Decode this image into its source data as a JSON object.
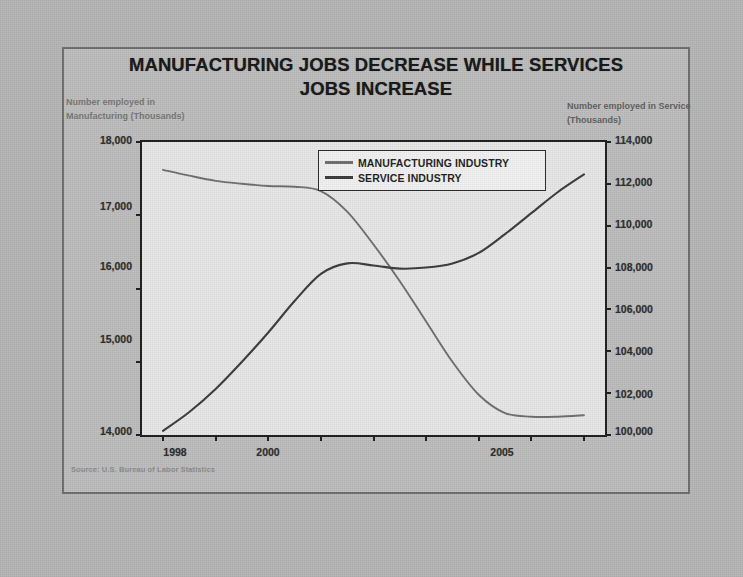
{
  "title": "MANUFACTURING JOBS DECREASE WHILE SERVICES JOBS INCREASE",
  "title_line1": "MANUFACTURING JOBS DECREASE WHILE SERVICES",
  "title_line2": "JOBS INCREASE",
  "left_axis_caption": "Number employed in Manufacturing (Thousands)",
  "right_axis_caption": "Number employed in Service (Thousands)",
  "source_note": "Source: U.S. Bureau of Labor Statistics",
  "legend": {
    "items": [
      {
        "label": "MANUFACTURING INDUSTRY",
        "color": "#6e6e6e"
      },
      {
        "label": "SERVICE INDUSTRY",
        "color": "#3a3a3a"
      }
    ]
  },
  "colors": {
    "page_background": "#b6b6b6",
    "slide_background": "#bdbdbd",
    "plot_background": "#e8e8e8",
    "axis": "#1c1c1c",
    "manufacturing_line": "#6e6e6e",
    "service_line": "#3a3a3a",
    "title_text": "#151515",
    "caption_text": "#767676"
  },
  "chart_data": {
    "type": "line",
    "title": "MANUFACTURING JOBS DECREASE WHILE SERVICES JOBS INCREASE",
    "subtitle": "",
    "xlabel": "",
    "grid": false,
    "legend_position": "top-center-inside",
    "source": "Source: U.S. Bureau of Labor Statistics",
    "xlim": [
      1997.6,
      2006.4
    ],
    "x_tick_values": [
      1998,
      1999,
      2000,
      2001,
      2002,
      2003,
      2004,
      2005,
      2006
    ],
    "x_tick_labels": [
      "1998",
      "",
      "2000",
      "",
      "",
      "",
      "",
      "2005",
      ""
    ],
    "axes": [
      {
        "id": "left",
        "label": "Number employed in Manufacturing (Thousands)",
        "ylim": [
          14000,
          18000
        ],
        "ticks": [
          14000,
          15000,
          16000,
          17000,
          18000
        ],
        "tick_labels": [
          "14,000",
          "15,000",
          "16,000",
          "17,000",
          "18,000"
        ]
      },
      {
        "id": "right",
        "label": "Number employed in Service (Thousands)",
        "ylim": [
          100000,
          114000
        ],
        "ticks": [
          100000,
          102000,
          104000,
          106000,
          108000,
          110000,
          112000,
          114000
        ],
        "tick_labels": [
          "100,000",
          "102,000",
          "104,000",
          "106,000",
          "108,000",
          "110,000",
          "112,000",
          "114,000"
        ]
      }
    ],
    "series": [
      {
        "name": "MANUFACTURING INDUSTRY",
        "axis": "left",
        "color": "#6e6e6e",
        "x": [
          1998.0,
          1998.5,
          1999.0,
          1999.5,
          2000.0,
          2000.5,
          2001.0,
          2001.5,
          2002.0,
          2002.5,
          2003.0,
          2003.5,
          2004.0,
          2004.5,
          2005.0,
          2005.5,
          2006.0
        ],
        "values": [
          17620,
          17540,
          17470,
          17430,
          17400,
          17390,
          17330,
          17050,
          16600,
          16100,
          15550,
          15000,
          14550,
          14300,
          14250,
          14250,
          14270
        ]
      },
      {
        "name": "SERVICE INDUSTRY",
        "axis": "right",
        "color": "#3a3a3a",
        "x": [
          1998.0,
          1998.5,
          1999.0,
          1999.5,
          2000.0,
          2000.5,
          2001.0,
          2001.5,
          2002.0,
          2002.5,
          2003.0,
          2003.5,
          2004.0,
          2004.5,
          2005.0,
          2005.5,
          2006.0
        ],
        "values": [
          100200,
          101100,
          102200,
          103500,
          104900,
          106400,
          107700,
          108200,
          108100,
          107950,
          108000,
          108200,
          108700,
          109600,
          110600,
          111600,
          112450
        ]
      }
    ],
    "annotations": [
      {
        "text": "Lines cross between 2001 and 2002",
        "x": 2001.6
      }
    ]
  },
  "ticks": {
    "left": [
      {
        "label": "18,000",
        "top": 134
      },
      {
        "label": "17,000",
        "top": 200
      },
      {
        "label": "16,000",
        "top": 260
      },
      {
        "label": "15,000",
        "top": 333
      },
      {
        "label": "14,000",
        "top": 425
      }
    ],
    "right": [
      {
        "label": "114,000",
        "top": 134
      },
      {
        "label": "112,000",
        "top": 176
      },
      {
        "label": "110,000",
        "top": 218
      },
      {
        "label": "108,000",
        "top": 261
      },
      {
        "label": "106,000",
        "top": 303
      },
      {
        "label": "104,000",
        "top": 345
      },
      {
        "label": "102,000",
        "top": 388
      },
      {
        "label": "100,000",
        "top": 425
      }
    ],
    "x": [
      {
        "label": "1998",
        "left": 145
      },
      {
        "label": "2000",
        "left": 238
      },
      {
        "label": "2005",
        "left": 472
      }
    ]
  }
}
